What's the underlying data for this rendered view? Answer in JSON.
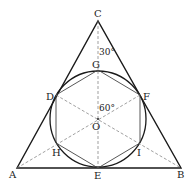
{
  "diagram": {
    "colors": {
      "stroke": "#1a1a1a",
      "hexagon": "#444444",
      "dashed": "#777777",
      "background": "#ffffff"
    },
    "points": {
      "A": {
        "label": "A",
        "x": 17,
        "y": 168
      },
      "B": {
        "label": "B",
        "x": 181,
        "y": 168
      },
      "C": {
        "label": "C",
        "x": 98,
        "y": 21
      },
      "O": {
        "label": "O",
        "x": 98,
        "y": 119
      },
      "G": {
        "label": "G",
        "x": 98,
        "y": 70
      },
      "D": {
        "label": "D",
        "x": 56,
        "y": 95
      },
      "F": {
        "label": "F",
        "x": 140,
        "y": 95
      },
      "H": {
        "label": "H",
        "x": 56,
        "y": 143
      },
      "I": {
        "label": "I",
        "x": 140,
        "y": 143
      },
      "E": {
        "label": "E",
        "x": 98,
        "y": 168
      }
    },
    "circle": {
      "center": "O",
      "radius": 48
    },
    "angles": {
      "top": "30°",
      "center": "60°"
    }
  }
}
